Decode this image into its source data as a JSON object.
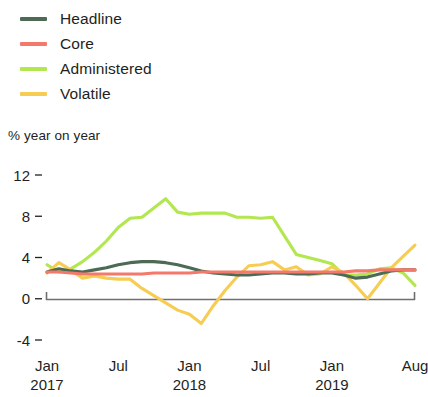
{
  "legend": {
    "position": "top-left",
    "items": [
      {
        "label": "Headline",
        "color": "#4d6a55",
        "name": "headline"
      },
      {
        "label": "Core",
        "color": "#f4796a",
        "name": "core"
      },
      {
        "label": "Administered",
        "color": "#b2e750",
        "name": "administered"
      },
      {
        "label": "Volatile",
        "color": "#f6cd52",
        "name": "volatile"
      }
    ]
  },
  "axis": {
    "y_title": "% year on year",
    "y_ticks": [
      "12",
      "8",
      "4",
      "0",
      "-4"
    ],
    "x_ticks": [
      {
        "label": "Jan",
        "sublabel": "2017"
      },
      {
        "label": "Jul",
        "sublabel": ""
      },
      {
        "label": "Jan",
        "sublabel": "2018"
      },
      {
        "label": "Jul",
        "sublabel": ""
      },
      {
        "label": "Jan",
        "sublabel": "2019"
      },
      {
        "label": "Aug",
        "sublabel": ""
      }
    ]
  },
  "chart_data": {
    "type": "line",
    "title": "",
    "subtitle": "",
    "xlabel": "",
    "ylabel": "% year on year",
    "ylim": [
      -4,
      12
    ],
    "ytick_values": [
      12,
      8,
      4,
      0,
      -4
    ],
    "grid": false,
    "legend_position": "top-left",
    "x": [
      "2017-01",
      "2017-02",
      "2017-03",
      "2017-04",
      "2017-05",
      "2017-06",
      "2017-07",
      "2017-08",
      "2017-09",
      "2017-10",
      "2017-11",
      "2017-12",
      "2018-01",
      "2018-02",
      "2018-03",
      "2018-04",
      "2018-05",
      "2018-06",
      "2018-07",
      "2018-08",
      "2018-09",
      "2018-10",
      "2018-11",
      "2018-12",
      "2019-01",
      "2019-02",
      "2019-03",
      "2019-04",
      "2019-05",
      "2019-06",
      "2019-07",
      "2019-08"
    ],
    "xtick_labels": [
      "Jan 2017",
      "Jul",
      "Jan 2018",
      "Jul",
      "Jan 2019",
      "Aug"
    ],
    "xtick_indices": [
      0,
      6,
      12,
      18,
      24,
      31
    ],
    "series": [
      {
        "name": "Headline",
        "color": "#4d6a55",
        "values": [
          2.6,
          2.9,
          2.7,
          2.6,
          2.8,
          3.0,
          3.3,
          3.5,
          3.6,
          3.6,
          3.5,
          3.3,
          3.0,
          2.7,
          2.5,
          2.4,
          2.3,
          2.3,
          2.4,
          2.5,
          2.5,
          2.4,
          2.4,
          2.5,
          2.5,
          2.3,
          2.0,
          2.1,
          2.4,
          2.7,
          2.8,
          2.8
        ]
      },
      {
        "name": "Core",
        "color": "#f4796a",
        "values": [
          2.6,
          2.6,
          2.5,
          2.4,
          2.4,
          2.4,
          2.4,
          2.4,
          2.4,
          2.5,
          2.5,
          2.5,
          2.5,
          2.6,
          2.6,
          2.6,
          2.6,
          2.6,
          2.6,
          2.6,
          2.6,
          2.6,
          2.6,
          2.6,
          2.6,
          2.6,
          2.7,
          2.7,
          2.8,
          2.8,
          2.8,
          2.8
        ]
      },
      {
        "name": "Administered",
        "color": "#b2e750",
        "values": [
          3.3,
          2.6,
          2.9,
          3.6,
          4.5,
          5.6,
          6.9,
          7.8,
          7.9,
          8.8,
          9.7,
          8.4,
          8.2,
          8.3,
          8.3,
          8.3,
          7.9,
          7.9,
          7.8,
          7.9,
          6.1,
          4.3,
          4.0,
          3.7,
          3.4,
          2.3,
          2.3,
          2.4,
          2.9,
          3.0,
          2.5,
          1.3
        ]
      },
      {
        "name": "Volatile",
        "color": "#f6cd52",
        "values": [
          2.5,
          3.5,
          2.8,
          2.0,
          2.2,
          2.0,
          1.9,
          1.9,
          1.0,
          0.3,
          -0.4,
          -1.1,
          -1.5,
          -2.4,
          -0.7,
          0.8,
          2.1,
          3.2,
          3.3,
          3.6,
          2.8,
          3.1,
          2.3,
          2.4,
          3.1,
          2.5,
          1.3,
          0.0,
          1.5,
          3.0,
          4.1,
          5.2
        ]
      }
    ]
  }
}
